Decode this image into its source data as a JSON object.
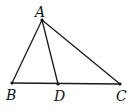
{
  "diagram": {
    "type": "triangle-with-cevian",
    "points": {
      "A": {
        "label": "A",
        "x": 42,
        "y": 20,
        "lx": 35,
        "ly": 17
      },
      "B": {
        "label": "B",
        "x": 12,
        "y": 83,
        "lx": 6,
        "ly": 100
      },
      "D": {
        "label": "D",
        "x": 58,
        "y": 84,
        "lx": 54,
        "ly": 101
      },
      "C": {
        "label": "C",
        "x": 120,
        "y": 84,
        "lx": 116,
        "ly": 101
      }
    },
    "segments": [
      [
        "A",
        "B"
      ],
      [
        "A",
        "C"
      ],
      [
        "A",
        "D"
      ],
      [
        "B",
        "C"
      ]
    ],
    "colors": {
      "stroke": "#1a1a1a",
      "background": "#ffffff"
    }
  }
}
